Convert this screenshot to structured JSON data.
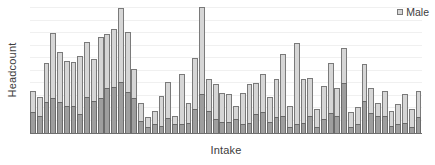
{
  "chart_data": {
    "type": "bar",
    "title": "",
    "subtitle": "",
    "xlabel": "Intake",
    "ylabel": "Headcount",
    "stacked": true,
    "grid": true,
    "axis_ticks_visible": false,
    "ylim": [
      0,
      100
    ],
    "legend": {
      "position": "top-right",
      "entries": [
        {
          "name": "Male",
          "color": "#d6d6d6"
        }
      ]
    },
    "colors": {
      "male_segment": "#d6d6d6",
      "other_segment": "#9e9e9e",
      "bar_outline": "#7a7a7a",
      "axis": "#6e6e6e",
      "gridline": "#f0f0f0",
      "text": "#3d3d3d",
      "background": "#ffffff"
    },
    "categories": [
      "1",
      "2",
      "3",
      "4",
      "5",
      "6",
      "7",
      "8",
      "9",
      "10",
      "11",
      "12",
      "13",
      "14",
      "15",
      "16",
      "17",
      "18",
      "19",
      "20",
      "21",
      "22",
      "23",
      "24",
      "25",
      "26",
      "27",
      "28",
      "29",
      "30",
      "31",
      "32",
      "33",
      "34",
      "35",
      "36",
      "37",
      "38",
      "39",
      "40",
      "41",
      "42",
      "43",
      "44",
      "45",
      "46",
      "47",
      "48",
      "49",
      "50",
      "51",
      "52",
      "53",
      "54",
      "55",
      "56",
      "57",
      "58"
    ],
    "series": [
      {
        "name": "Female",
        "color": "#9e9e9e",
        "values": [
          17,
          14,
          25,
          28,
          25,
          22,
          22,
          15,
          29,
          26,
          28,
          36,
          37,
          41,
          33,
          28,
          10,
          5,
          7,
          6,
          12,
          7,
          7,
          8,
          19,
          31,
          18,
          11,
          9,
          9,
          11,
          7,
          8,
          15,
          17,
          9,
          13,
          14,
          5,
          7,
          8,
          14,
          5,
          11,
          16,
          14,
          40,
          5,
          7,
          26,
          16,
          14,
          14,
          6,
          7,
          8,
          5,
          13
        ]
      },
      {
        "name": "Male",
        "color": "#d6d6d6",
        "values": [
          17,
          15,
          31,
          52,
          40,
          36,
          35,
          47,
          44,
          33,
          49,
          43,
          46,
          59,
          48,
          23,
          14,
          8,
          11,
          24,
          29,
          7,
          40,
          16,
          41,
          70,
          25,
          28,
          23,
          22,
          11,
          25,
          31,
          25,
          30,
          20,
          30,
          49,
          17,
          65,
          35,
          30,
          14,
          27,
          40,
          22,
          28,
          12,
          14,
          29,
          20,
          10,
          20,
          12,
          16,
          23,
          14,
          21
        ]
      }
    ]
  }
}
